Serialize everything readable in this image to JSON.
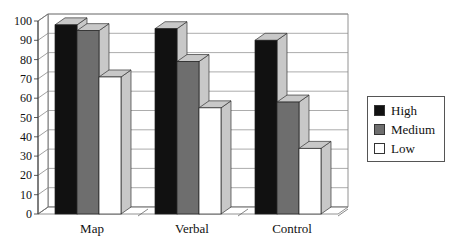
{
  "chart_data": {
    "type": "bar",
    "style": "3d-clustered-column",
    "title": "",
    "xlabel": "",
    "ylabel": "",
    "categories": [
      "Map",
      "Verbal",
      "Control"
    ],
    "series": [
      {
        "name": "High",
        "values": [
          98,
          96,
          90
        ],
        "color": "#111111"
      },
      {
        "name": "Medium",
        "values": [
          95,
          79,
          58
        ],
        "color": "#6e6e6e"
      },
      {
        "name": "Low",
        "values": [
          71,
          55,
          34
        ],
        "color": "#ffffff"
      }
    ],
    "ylim": [
      0,
      100
    ],
    "yticks": [
      0,
      10,
      20,
      30,
      40,
      50,
      60,
      70,
      80,
      90,
      100
    ],
    "grid": true,
    "legend_position": "right"
  },
  "legend": {
    "items": [
      {
        "label": "High",
        "color": "#111111"
      },
      {
        "label": "Medium",
        "color": "#6e6e6e"
      },
      {
        "label": "Low",
        "color": "#ffffff"
      }
    ]
  }
}
